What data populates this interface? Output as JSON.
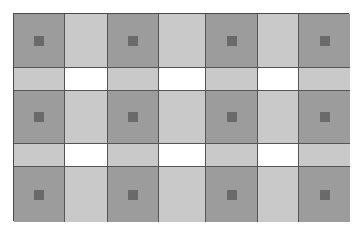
{
  "diagram": {
    "type": "grid-pattern",
    "columns_px": [
      51,
      43,
      51,
      47,
      52,
      41,
      51
    ],
    "rows_px": [
      54,
      23,
      53,
      23,
      55
    ],
    "colors": {
      "dark": "#9c9c9c",
      "light": "#c9c9c9",
      "white": "#ffffff",
      "marker": "#6a6a6a",
      "border": "#4a4a4a"
    },
    "rows": [
      [
        "dark-marker",
        "light",
        "dark-marker",
        "light",
        "dark-marker",
        "light",
        "dark-marker"
      ],
      [
        "light",
        "white",
        "light",
        "white",
        "light",
        "white",
        "light"
      ],
      [
        "dark-marker",
        "light",
        "dark-marker",
        "light",
        "dark-marker",
        "light",
        "dark-marker"
      ],
      [
        "light",
        "white",
        "light",
        "white",
        "light",
        "white",
        "light"
      ],
      [
        "dark-marker",
        "light",
        "dark-marker",
        "light",
        "dark-marker",
        "light",
        "dark-marker"
      ]
    ]
  },
  "caption": ""
}
